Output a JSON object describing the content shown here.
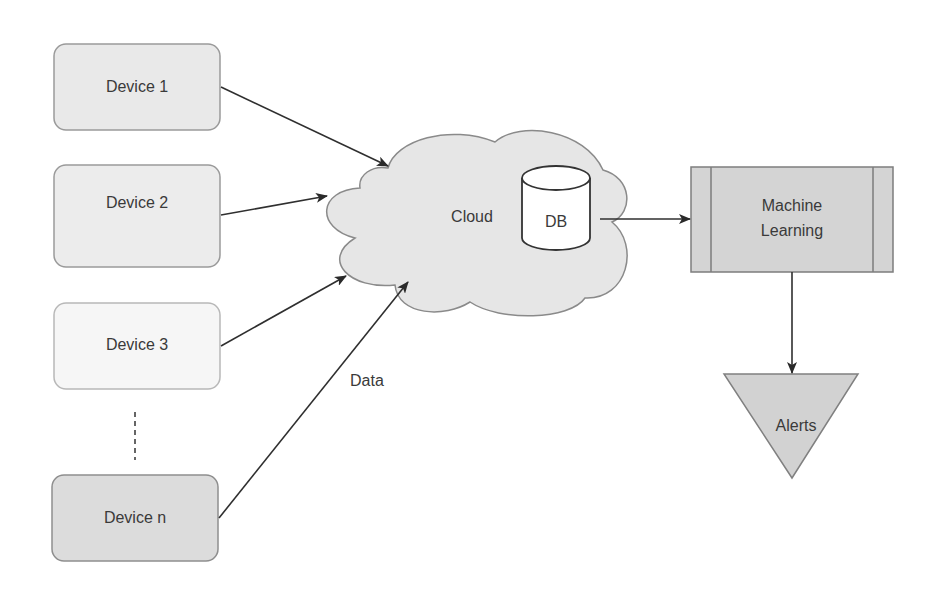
{
  "devices": [
    {
      "label": "Device 1",
      "fill": "#e9e9e9",
      "stroke": "#9a9a9a"
    },
    {
      "label": "Device 2",
      "fill": "#ececec",
      "stroke": "#9a9a9a"
    },
    {
      "label": "Device 3",
      "fill": "#f6f6f6",
      "stroke": "#b8b8b8"
    },
    {
      "label": "Device n",
      "fill": "#dcdcdc",
      "stroke": "#8e8e8e"
    }
  ],
  "ellipsis": "vertical-dashed-line",
  "cloud": {
    "label": "Cloud",
    "fill": "#e6e6e6",
    "stroke": "#8a8a8a"
  },
  "database": {
    "label": "DB",
    "fill": "#ffffff",
    "stroke": "#333333"
  },
  "ml": {
    "line1": "Machine",
    "line2": "Learning",
    "fill": "#d4d4d4",
    "stroke": "#7d7d7d"
  },
  "alerts": {
    "label": "Alerts",
    "fill": "#d2d2d2",
    "stroke": "#808080"
  },
  "edge_label": "Data",
  "edges": [
    {
      "from": "Device 1",
      "to": "Cloud"
    },
    {
      "from": "Device 2",
      "to": "Cloud"
    },
    {
      "from": "Device 3",
      "to": "Cloud"
    },
    {
      "from": "Device n",
      "to": "Cloud",
      "label": "Data"
    },
    {
      "from": "DB",
      "to": "Machine Learning"
    },
    {
      "from": "Machine Learning",
      "to": "Alerts"
    }
  ]
}
